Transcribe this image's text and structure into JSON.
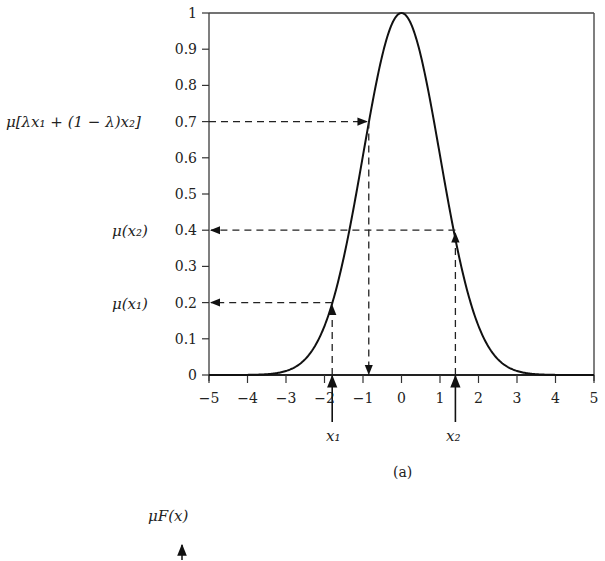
{
  "figure": {
    "panel_label": "(a)",
    "next_panel_ylabel": "μF(x)",
    "annotations": {
      "y_mu_mix": "μ[λx₁ + (1 − λ)x₂]",
      "y_mu_x2": "μ(x₂)",
      "y_mu_x1": "μ(x₁)",
      "x1_label": "x₁",
      "x2_label": "x₂"
    }
  },
  "chart_data": {
    "type": "line",
    "title": "",
    "xlabel": "",
    "ylabel": "",
    "xlim": [
      -5,
      5
    ],
    "ylim": [
      0,
      1
    ],
    "grid": false,
    "legend": null,
    "x_ticks": [
      "-5",
      "-4",
      "-3",
      "-2",
      "-1",
      "0",
      "1",
      "2",
      "3",
      "4",
      "5"
    ],
    "y_ticks": [
      "0",
      "0.1",
      "0.2",
      "0.3",
      "0.4",
      "0.5",
      "0.6",
      "0.7",
      "0.8",
      "0.9",
      "1"
    ],
    "series": [
      {
        "name": "Gaussian membership function μ(x) = exp(-x²/2)",
        "x": [
          -5,
          -4,
          -3.5,
          -3,
          -2.5,
          -2,
          -1.8,
          -1.5,
          -1,
          -0.845,
          -0.5,
          0,
          0.5,
          1,
          1.4,
          1.5,
          2,
          2.5,
          3,
          3.5,
          4,
          5
        ],
        "y": [
          0.0,
          0.0003,
          0.002,
          0.011,
          0.044,
          0.135,
          0.2,
          0.325,
          0.607,
          0.7,
          0.882,
          1.0,
          0.882,
          0.607,
          0.4,
          0.325,
          0.135,
          0.044,
          0.011,
          0.002,
          0.0003,
          0.0
        ]
      }
    ],
    "annotations": [
      {
        "label": "x₁",
        "x": -1.8,
        "mu": 0.2,
        "y_label": "μ(x₁)"
      },
      {
        "label": "x₂",
        "x": 1.4,
        "mu": 0.4,
        "y_label": "μ(x₂)"
      },
      {
        "label": "λx₁ + (1 − λ)x₂",
        "x": -0.85,
        "mu": 0.7,
        "y_label": "μ[λx₁ + (1 − λ)x₂]"
      }
    ],
    "panel": "(a)"
  }
}
